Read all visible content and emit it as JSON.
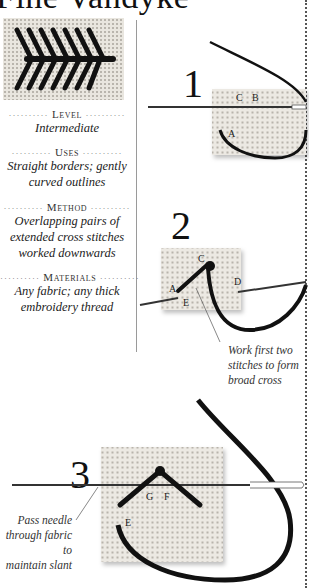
{
  "title": "Fine Vandyke",
  "info": [
    {
      "heading": "Level",
      "value": "Intermediate"
    },
    {
      "heading": "Uses",
      "value_lines": [
        "Straight borders; gently",
        "curved outlines"
      ]
    },
    {
      "heading": "Method",
      "value_lines": [
        "Overlapping pairs of",
        "extended cross stitches",
        "worked downwards"
      ]
    },
    {
      "heading": "Materials",
      "value_lines": [
        "Any fabric; any thick",
        "embroidery thread"
      ]
    }
  ],
  "steps": [
    {
      "number": "1",
      "labels": [
        "C",
        "B",
        "A"
      ]
    },
    {
      "number": "2",
      "labels": [
        "C",
        "A",
        "E",
        "D"
      ],
      "caption_lines": [
        "Work first two",
        "stitches to form",
        "broad cross"
      ]
    },
    {
      "number": "3",
      "labels": [
        "G",
        "F",
        "E"
      ],
      "caption_lines": [
        "Pass needle",
        "through fabric to",
        "maintain slant"
      ]
    }
  ],
  "dots": "··········"
}
